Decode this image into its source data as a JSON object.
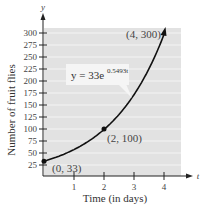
{
  "chart_data": {
    "type": "line",
    "title": "",
    "xlabel": "Time (in days)",
    "ylabel": "Number of fruit flies",
    "x_axis_var": "t",
    "y_axis_var": "y",
    "xlim": [
      0,
      4.5
    ],
    "ylim": [
      0,
      300
    ],
    "x_ticks": [
      "1",
      "2",
      "3",
      "4"
    ],
    "y_ticks": [
      "25",
      "50",
      "75",
      "100",
      "125",
      "150",
      "175",
      "200",
      "225",
      "250",
      "275",
      "300"
    ],
    "grid": true,
    "equation": {
      "base": "y = 33e",
      "exponent": "0.5493t"
    },
    "series": [
      {
        "name": "y = 33e^(0.5493t)",
        "x": [
          0,
          0.5,
          1,
          1.5,
          2,
          2.5,
          3,
          3.5,
          4
        ],
        "values": [
          33,
          43.4,
          57.3,
          75.4,
          99.4,
          130.9,
          172.6,
          227.3,
          299.6
        ]
      }
    ],
    "annotations": [
      {
        "label": "(0, 33)",
        "x": 0,
        "y": 33
      },
      {
        "label": "(2, 100)",
        "x": 2,
        "y": 100
      },
      {
        "label": "(4, 300)",
        "x": 4,
        "y": 300
      }
    ]
  }
}
